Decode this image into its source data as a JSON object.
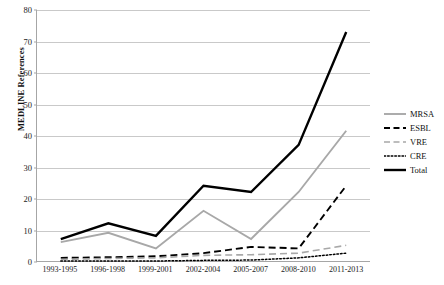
{
  "chart_data": {
    "type": "line",
    "title": "",
    "xlabel": "",
    "ylabel": "MEDLINE References",
    "ylim": [
      0,
      80
    ],
    "yticks": [
      0,
      10,
      20,
      30,
      40,
      50,
      60,
      70,
      80
    ],
    "grid": true,
    "legend_position": "right",
    "categories": [
      "1993-1995",
      "1996-1998",
      "1999-2001",
      "2002-2004",
      "2005-2007",
      "2008-2010",
      "2011-2013"
    ],
    "series": [
      {
        "name": "MRSA",
        "color": "#a8a8a8",
        "style": "solid",
        "width": 1.9,
        "values": [
          6,
          9,
          4,
          16,
          7,
          22,
          41.5
        ]
      },
      {
        "name": "ESBL",
        "color": "#000000",
        "style": "dashed",
        "width": 1.9,
        "values": [
          1,
          1.2,
          1.5,
          2.5,
          4.5,
          4,
          24
        ]
      },
      {
        "name": "VRE",
        "color": "#a8a8a8",
        "style": "dashed",
        "width": 1.6,
        "values": [
          0.5,
          0.8,
          1,
          1.8,
          2,
          2.5,
          5
        ]
      },
      {
        "name": "CRE",
        "color": "#000000",
        "style": "dotted",
        "width": 1.5,
        "values": [
          0,
          0,
          0,
          0.2,
          0.3,
          1,
          2.5
        ]
      },
      {
        "name": "Total",
        "color": "#000000",
        "style": "solid",
        "width": 2.4,
        "values": [
          7,
          12,
          8,
          24,
          22,
          37,
          73
        ]
      }
    ]
  },
  "axis": {
    "y_title": "MEDLINE References",
    "y_tick_labels": [
      "0",
      "10",
      "20",
      "30",
      "40",
      "50",
      "60",
      "70",
      "80"
    ],
    "x_tick_labels": [
      "1993-1995",
      "1996-1998",
      "1999-2001",
      "2002-2004",
      "2005-2007",
      "2008-2010",
      "2011-2013"
    ]
  },
  "legend": {
    "entries": [
      {
        "label": "MRSA"
      },
      {
        "label": "ESBL"
      },
      {
        "label": "VRE"
      },
      {
        "label": "CRE"
      },
      {
        "label": "Total"
      }
    ]
  },
  "colors": {
    "series_gray": "#a8a8a8",
    "series_black": "#000000",
    "gridline": "#c9c9c9",
    "axis": "#a6a6a6",
    "background": "#ffffff"
  }
}
